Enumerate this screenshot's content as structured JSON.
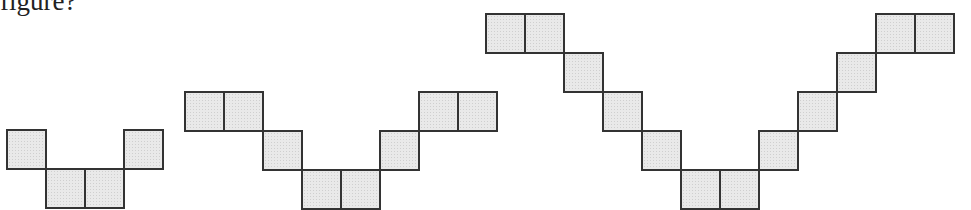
{
  "question": {
    "text": "figure?"
  },
  "style": {
    "cell_fill": "#e9e9e9",
    "cell_border": "#333333",
    "cell_size": 39
  },
  "figures": [
    {
      "name": "figure-1",
      "origin_x": 6,
      "base_y": 168,
      "cells": [
        [
          0,
          1
        ],
        [
          1,
          0
        ],
        [
          2,
          0
        ],
        [
          3,
          1
        ]
      ]
    },
    {
      "name": "figure-2",
      "origin_x": 184,
      "base_y": 169,
      "cells": [
        [
          0,
          2
        ],
        [
          1,
          2
        ],
        [
          2,
          1
        ],
        [
          3,
          0
        ],
        [
          4,
          0
        ],
        [
          5,
          1
        ],
        [
          6,
          2
        ],
        [
          7,
          2
        ]
      ]
    },
    {
      "name": "figure-3",
      "origin_x": 485,
      "base_y": 169,
      "cells": [
        [
          0,
          4
        ],
        [
          1,
          4
        ],
        [
          2,
          3
        ],
        [
          3,
          2
        ],
        [
          4,
          1
        ],
        [
          5,
          0
        ],
        [
          6,
          0
        ],
        [
          7,
          1
        ],
        [
          8,
          2
        ],
        [
          9,
          3
        ],
        [
          10,
          4
        ],
        [
          11,
          4
        ]
      ]
    }
  ]
}
